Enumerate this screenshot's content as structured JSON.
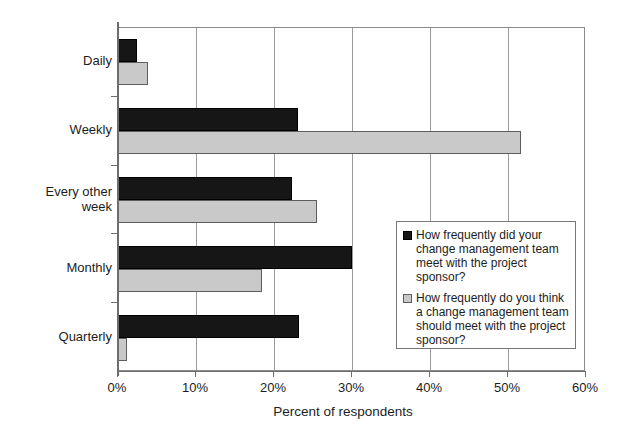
{
  "chart_data": {
    "type": "bar",
    "orientation": "horizontal",
    "title": "",
    "xlabel": "Percent of respondents",
    "ylabel": "",
    "xlim": [
      0,
      60
    ],
    "xticks": [
      "0%",
      "10%",
      "20%",
      "30%",
      "40%",
      "50%",
      "60%"
    ],
    "grid": true,
    "legend_position": "inside-right",
    "categories": [
      "Daily",
      "Weekly",
      "Every other week",
      "Monthly",
      "Quarterly"
    ],
    "series": [
      {
        "name": "How frequently did your change management team meet with the project sponsor?",
        "color": "#161616",
        "values": [
          2.4,
          23.1,
          22.3,
          30.0,
          23.2
        ]
      },
      {
        "name": "How frequently do you think a change management team should meet with the project sponsor?",
        "color": "#c9c9c9",
        "values": [
          3.8,
          51.7,
          25.5,
          18.4,
          1.2
        ]
      }
    ]
  },
  "axis": {
    "x_title": "Percent of respondents",
    "x_tick_labels": [
      "0%",
      "10%",
      "20%",
      "30%",
      "40%",
      "50%",
      "60%"
    ],
    "y_tick_labels": [
      "Daily",
      "Weekly",
      "Every other week",
      "Monthly",
      "Quarterly"
    ]
  },
  "legend": {
    "entries": [
      {
        "swatch": "dark",
        "label": "How frequently did your change management team meet with the project sponsor?"
      },
      {
        "swatch": "light",
        "label": "How frequently do you think a change management team should meet with the project sponsor?"
      }
    ]
  },
  "colors": {
    "series_dark": "#161616",
    "series_light": "#c9c9c9",
    "gridline": "#9a9a9a",
    "axis": "#6d6d6d",
    "text": "#1d1d1d",
    "background": "#ffffff"
  }
}
